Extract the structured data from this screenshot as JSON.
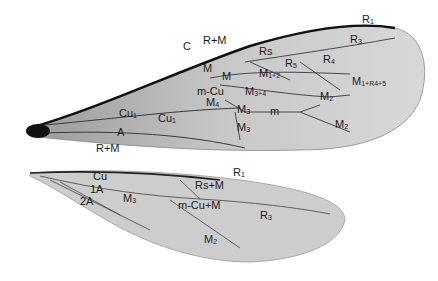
{
  "figure": {
    "forewing_labels": [
      {
        "text": "C",
        "x": 183,
        "y": 50
      },
      {
        "text": "R+M",
        "x": 203,
        "y": 44
      },
      {
        "text": "R1",
        "x": 362,
        "y": 23
      },
      {
        "text": "R3",
        "x": 350,
        "y": 43
      },
      {
        "text": "Rs",
        "x": 259,
        "y": 55
      },
      {
        "text": "R5",
        "x": 285,
        "y": 67
      },
      {
        "text": "R4",
        "x": 323,
        "y": 63
      },
      {
        "text": "M",
        "x": 203,
        "y": 72
      },
      {
        "text": "M",
        "x": 222,
        "y": 80
      },
      {
        "text": "M1+2",
        "x": 259,
        "y": 77
      },
      {
        "text": "M1+R4+5",
        "x": 352,
        "y": 85
      },
      {
        "text": "m-Cu",
        "x": 197,
        "y": 95
      },
      {
        "text": "M3+4",
        "x": 245,
        "y": 95
      },
      {
        "text": "M2",
        "x": 320,
        "y": 100
      },
      {
        "text": "M4",
        "x": 206,
        "y": 106
      },
      {
        "text": "Cu1",
        "x": 119,
        "y": 117
      },
      {
        "text": "Cu1",
        "x": 158,
        "y": 122
      },
      {
        "text": "M3",
        "x": 237,
        "y": 113
      },
      {
        "text": "m",
        "x": 270,
        "y": 115
      },
      {
        "text": "M3",
        "x": 237,
        "y": 131
      },
      {
        "text": "M2",
        "x": 335,
        "y": 128
      },
      {
        "text": "A",
        "x": 117,
        "y": 136
      }
    ],
    "hindwing_labels": [
      {
        "text": "R+M",
        "x": 96,
        "y": 152
      },
      {
        "text": "R1",
        "x": 233,
        "y": 176
      },
      {
        "text": "Cu",
        "x": 93,
        "y": 180
      },
      {
        "text": "1A",
        "x": 90,
        "y": 193
      },
      {
        "text": "Rs+M",
        "x": 195,
        "y": 189
      },
      {
        "text": "2A",
        "x": 80,
        "y": 205
      },
      {
        "text": "M3",
        "x": 123,
        "y": 202
      },
      {
        "text": "m-Cu+M",
        "x": 178,
        "y": 209
      },
      {
        "text": "R3",
        "x": 260,
        "y": 219
      },
      {
        "text": "M2",
        "x": 204,
        "y": 243
      }
    ],
    "colors": {
      "background": "#ffffff",
      "wing_fill": "#cfcfcf",
      "vein": "#3a3a3a",
      "costa": "#111111"
    }
  }
}
